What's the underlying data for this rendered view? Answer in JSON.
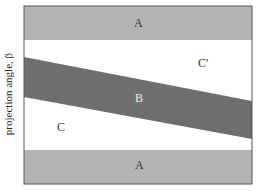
{
  "diagram": {
    "ylabel": "projection angle, β",
    "regions": [
      {
        "id": "A-top",
        "label": "A",
        "color": "#b4b4b4"
      },
      {
        "id": "B",
        "label": "B",
        "color": "#6e6e6e"
      },
      {
        "id": "C",
        "label": "C",
        "color": "#ffffff"
      },
      {
        "id": "C-prime",
        "label": "C′",
        "color": "#ffffff"
      },
      {
        "id": "A-bottom",
        "label": "A",
        "color": "#b4b4b4"
      }
    ]
  }
}
